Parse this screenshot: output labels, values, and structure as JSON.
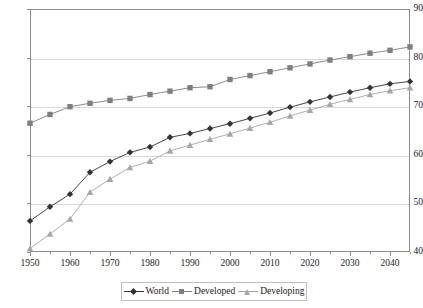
{
  "chart_data": {
    "type": "line",
    "title": "",
    "subtitle": "",
    "xlabel": "",
    "ylabel": "",
    "xlim": [
      1950,
      2045
    ],
    "ylim": [
      40,
      90
    ],
    "grid": true,
    "legend_position": "bottom",
    "y_ticks": [
      40,
      50,
      60,
      70,
      80,
      90
    ],
    "x_ticks": [
      1950,
      1960,
      1970,
      1980,
      1990,
      2000,
      2010,
      2020,
      2030,
      2040
    ],
    "x_minor_ticks": [
      1955,
      1965,
      1975,
      1985,
      1995,
      2005,
      2015,
      2025,
      2035,
      2045
    ],
    "x": [
      1950,
      1955,
      1960,
      1965,
      1970,
      1975,
      1980,
      1985,
      1990,
      1995,
      2000,
      2005,
      2010,
      2015,
      2020,
      2025,
      2030,
      2035,
      2040,
      2045
    ],
    "series": [
      {
        "name": "World",
        "marker": "diamond",
        "color": "#333333",
        "values": [
          46.4,
          49.3,
          51.9,
          56.4,
          58.6,
          60.5,
          61.6,
          63.6,
          64.4,
          65.4,
          66.4,
          67.5,
          68.6,
          69.8,
          70.9,
          71.9,
          72.9,
          73.8,
          74.6,
          75.1
        ]
      },
      {
        "name": "Developed",
        "marker": "square",
        "color": "#7f7f7f",
        "values": [
          66.5,
          68.3,
          69.9,
          70.6,
          71.2,
          71.6,
          72.4,
          73.1,
          73.8,
          74.0,
          75.5,
          76.3,
          77.1,
          77.9,
          78.7,
          79.5,
          80.2,
          80.9,
          81.5,
          82.2
        ]
      },
      {
        "name": "Developing",
        "marker": "triangle",
        "color": "#a6a6a6",
        "values": [
          40.7,
          43.7,
          46.8,
          52.3,
          55.0,
          57.4,
          58.7,
          60.8,
          62.0,
          63.2,
          64.3,
          65.5,
          66.7,
          68.0,
          69.2,
          70.4,
          71.4,
          72.4,
          73.2,
          73.8
        ]
      }
    ]
  },
  "legend": {
    "entries": [
      {
        "label": "World"
      },
      {
        "label": "Developed"
      },
      {
        "label": "Developing"
      }
    ]
  }
}
